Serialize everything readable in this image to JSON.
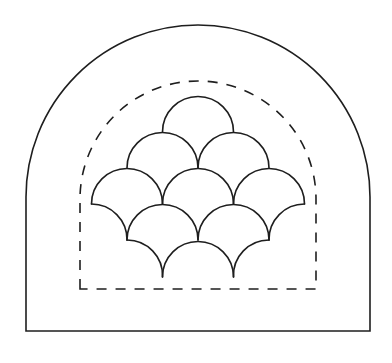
{
  "figure": {
    "stroke_color": "#1e1e1e",
    "background": "#ffffff",
    "outer_arch": {
      "left": 26,
      "right": 370,
      "top": 25,
      "bottom": 331,
      "arc_center_y": 197
    },
    "dashed_arch": {
      "left": 80,
      "right": 316,
      "top": 81,
      "bottom": 289,
      "arc_center_y": 199
    },
    "clamshells": {
      "radius": 35.5,
      "rows": [
        {
          "y": 132,
          "x": [
            198
          ]
        },
        {
          "y": 168,
          "x": [
            162.5,
            233.5
          ]
        },
        {
          "y": 204,
          "x": [
            127,
            198,
            269
          ]
        },
        {
          "y": 240,
          "x": [
            162.5,
            233.5
          ]
        },
        {
          "y": 277,
          "x": [
            198
          ]
        }
      ],
      "count_visible": 9
    }
  }
}
